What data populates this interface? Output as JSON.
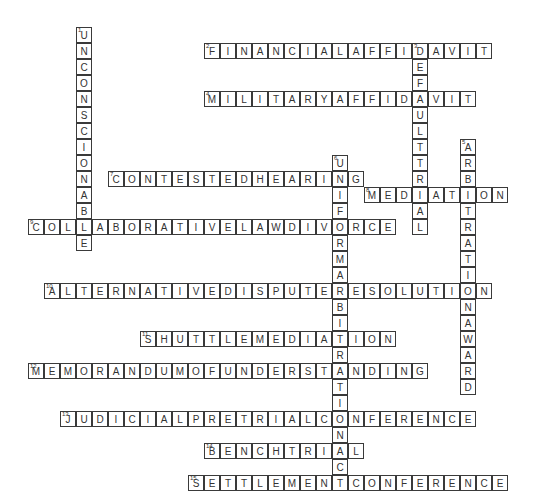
{
  "puzzle": {
    "cell_size": 16,
    "origin_x": 12,
    "origin_y": 27,
    "words": [
      {
        "number": 1,
        "answer": "UNCONSCIONABLE",
        "direction": "down",
        "col": 4,
        "row": 0
      },
      {
        "number": 2,
        "answer": "FINANCIALAFFIDAVIT",
        "direction": "across",
        "col": 12,
        "row": 1
      },
      {
        "number": 3,
        "answer": "DEFAULTTRIAL",
        "direction": "down",
        "col": 25,
        "row": 1
      },
      {
        "number": 4,
        "answer": "MILITARYAFFIDAVIT",
        "direction": "across",
        "col": 12,
        "row": 4
      },
      {
        "number": 5,
        "answer": "ARBITRATIONAWARD",
        "direction": "down",
        "col": 28,
        "row": 7
      },
      {
        "number": 6,
        "answer": "UNIFORMARBITRATIONACT",
        "direction": "down",
        "col": 20,
        "row": 8
      },
      {
        "number": 7,
        "answer": "CONTESTEDHEARING",
        "direction": "across",
        "col": 6,
        "row": 9
      },
      {
        "number": 8,
        "answer": "MEDIATION",
        "direction": "across",
        "col": 22,
        "row": 10
      },
      {
        "number": 9,
        "answer": "COLLABORATIVELAWDIVORCE",
        "direction": "across",
        "col": 1,
        "row": 12
      },
      {
        "number": 10,
        "answer": "ALTERNATIVEDISPUTERESOLUTION",
        "direction": "across",
        "col": 2,
        "row": 16
      },
      {
        "number": 11,
        "answer": "SHUTTLEMEDIATION",
        "direction": "across",
        "col": 8,
        "row": 19
      },
      {
        "number": 12,
        "answer": "MEMORANDUMOFUNDERSTANDING",
        "direction": "across",
        "col": 1,
        "row": 21
      },
      {
        "number": 13,
        "answer": "JUDICIALPRETRIALCONFERENCE",
        "direction": "across",
        "col": 3,
        "row": 24
      },
      {
        "number": 14,
        "answer": "BENCHTRIAL",
        "direction": "across",
        "col": 12,
        "row": 26
      },
      {
        "number": 15,
        "answer": "SETTLEMENTCONFERENCE",
        "direction": "across",
        "col": 11,
        "row": 28
      }
    ]
  }
}
